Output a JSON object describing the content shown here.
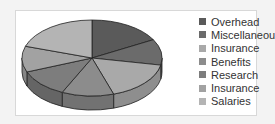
{
  "chart_data": {
    "type": "pie",
    "style": "3d",
    "title": "",
    "categories": [
      "Overhead",
      "Miscellaneous",
      "Insurance",
      "Benefits",
      "Research",
      "Insurance",
      "Salaries"
    ],
    "values": [
      17,
      11,
      17,
      12,
      12,
      11,
      20
    ],
    "colors": [
      "#5a5a5a",
      "#6b6b6b",
      "#a9a9a9",
      "#8c8c8c",
      "#7d7d7d",
      "#a2a2a2",
      "#b4b4b4"
    ],
    "side_colors": [
      "#484848",
      "#565656",
      "#8e8e8e",
      "#727272",
      "#656565",
      "#868686",
      "#989898"
    ],
    "legend_position": "right",
    "grid": false
  },
  "legend": {
    "items": [
      {
        "label": "Overhead",
        "color": "#5a5a5a"
      },
      {
        "label": "Miscellaneous",
        "color": "#6b6b6b"
      },
      {
        "label": "Insurance",
        "color": "#a9a9a9"
      },
      {
        "label": "Benefits",
        "color": "#8c8c8c"
      },
      {
        "label": "Research",
        "color": "#7d7d7d"
      },
      {
        "label": "Insurance",
        "color": "#a2a2a2"
      },
      {
        "label": "Salaries",
        "color": "#b4b4b4"
      }
    ]
  }
}
